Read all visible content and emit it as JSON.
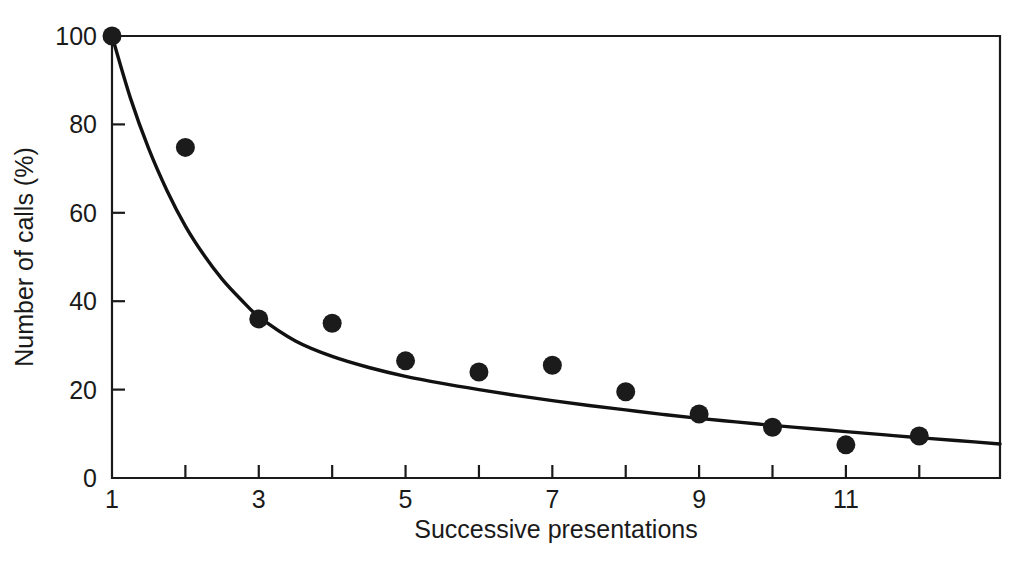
{
  "figure": {
    "background_color": "#ffffff",
    "ink_color": "#1a1a1a",
    "marker_color": "#1b1b1b",
    "curve_color": "#111111"
  },
  "axes": {
    "y_title": "Number of calls (%)",
    "x_title": "Successive presentations",
    "y_ticks": [
      {
        "value": 0,
        "label": "0"
      },
      {
        "value": 20,
        "label": "20"
      },
      {
        "value": 40,
        "label": "40"
      },
      {
        "value": 60,
        "label": "60"
      },
      {
        "value": 80,
        "label": "80"
      },
      {
        "value": 100,
        "label": "100"
      }
    ],
    "x_ticks": [
      {
        "value": 1,
        "label": "1"
      },
      {
        "value": 2,
        "label": ""
      },
      {
        "value": 3,
        "label": "3"
      },
      {
        "value": 4,
        "label": ""
      },
      {
        "value": 5,
        "label": "5"
      },
      {
        "value": 6,
        "label": ""
      },
      {
        "value": 7,
        "label": "7"
      },
      {
        "value": 8,
        "label": ""
      },
      {
        "value": 9,
        "label": "9"
      },
      {
        "value": 10,
        "label": ""
      },
      {
        "value": 11,
        "label": "11"
      },
      {
        "value": 12,
        "label": ""
      }
    ]
  },
  "chart_data": {
    "type": "scatter",
    "title": "",
    "xlabel": "Successive presentations",
    "ylabel": "Number of calls (%)",
    "xlim": [
      1,
      13.1
    ],
    "ylim": [
      0,
      100
    ],
    "grid": false,
    "legend": "none",
    "x": [
      1,
      2,
      3,
      4,
      5,
      6,
      7,
      8,
      9,
      10,
      11,
      12
    ],
    "series": [
      {
        "name": "Observed number of calls",
        "type": "scatter",
        "marker": "filled-circle",
        "values": [
          100,
          74.8,
          36,
          35,
          26.5,
          24,
          25.5,
          19.5,
          14.5,
          11.5,
          7.5,
          9.5
        ]
      },
      {
        "name": "Fitted decay curve",
        "type": "line",
        "x": [
          1,
          1.25,
          1.5,
          1.75,
          2,
          2.25,
          2.5,
          2.75,
          3,
          3.5,
          4,
          4.5,
          5,
          5.5,
          6,
          6.5,
          7,
          7.5,
          8,
          8.5,
          9,
          9.5,
          10,
          10.5,
          11,
          11.5,
          12,
          12.5,
          13.1
        ],
        "values": [
          100,
          86,
          74.5,
          65,
          57,
          50.5,
          45,
          40.5,
          36.5,
          31,
          27.5,
          25,
          23,
          21.4,
          20,
          18.7,
          17.5,
          16.4,
          15.4,
          14.4,
          13.5,
          12.7,
          11.9,
          11.2,
          10.5,
          9.8,
          9.1,
          8.5,
          7.7
        ]
      }
    ]
  }
}
